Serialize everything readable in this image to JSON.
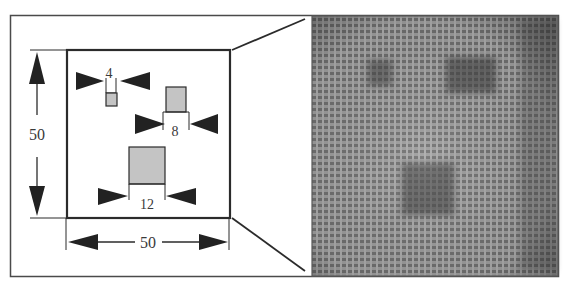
{
  "figure": {
    "schematic": {
      "width_label": "50",
      "height_label": "50",
      "defects": [
        {
          "label": "4",
          "size": 4
        },
        {
          "label": "8",
          "size": 8
        },
        {
          "label": "12",
          "size": 12
        }
      ]
    },
    "image_panel": {
      "dark_regions": [
        {
          "name": "defect-4-image"
        },
        {
          "name": "defect-8-image"
        },
        {
          "name": "defect-12-image"
        }
      ]
    },
    "colors": {
      "stroke": "#2b2b2b",
      "defect_fill": "#c4c4c4",
      "image_bg": "#8e8e8e",
      "image_dark": "#4a4a4a"
    }
  }
}
